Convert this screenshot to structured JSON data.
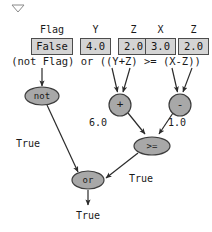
{
  "diagram": {
    "title_marker": "collapse-triangle",
    "variables": [
      {
        "name": "Flag",
        "value": "False",
        "box_width": 42
      },
      {
        "name": "Y",
        "value": "4.0",
        "box_width": 31
      },
      {
        "name": "Z",
        "value": "2.0",
        "box_width": 31
      },
      {
        "name": "X",
        "value": "3.0",
        "box_width": 31
      },
      {
        "name": "Z",
        "value": "2.0",
        "box_width": 31
      }
    ],
    "expression": {
      "part_left": "(not Flag)",
      "operator": " or ",
      "part_right": "((Y+Z) >= (X-Z))",
      "full": "(not Flag) or ((Y+Z) >= (X-Z))"
    },
    "nodes": [
      {
        "id": "not",
        "label": "not",
        "shape": "ellipse",
        "cx": 42,
        "cy": 96,
        "rx": 17,
        "ry": 9
      },
      {
        "id": "plus",
        "label": "+",
        "shape": "circle",
        "cx": 120,
        "cy": 105,
        "rx": 11,
        "ry": 11
      },
      {
        "id": "minus",
        "label": "-",
        "shape": "circle",
        "cx": 180,
        "cy": 105,
        "rx": 11,
        "ry": 11
      },
      {
        "id": "gte",
        "label": ">=",
        "shape": "ellipse",
        "cx": 152,
        "cy": 146,
        "rx": 18,
        "ry": 9
      },
      {
        "id": "or",
        "label": "or",
        "shape": "ellipse",
        "cx": 88,
        "cy": 180,
        "rx": 16,
        "ry": 9
      }
    ],
    "edge_labels": [
      {
        "id": "not-to-or",
        "text": "True",
        "x": 24,
        "y": 143
      },
      {
        "id": "plus-to-gte",
        "text": "6.0",
        "x": 97,
        "y": 122
      },
      {
        "id": "minus-to-gte",
        "text": "1.0",
        "x": 176,
        "y": 122
      },
      {
        "id": "gte-to-or",
        "text": "True",
        "x": 141,
        "y": 178
      },
      {
        "id": "or-output",
        "text": "True",
        "x": 88,
        "y": 215
      }
    ],
    "colors": {
      "node_fill": "#a8a8a8",
      "node_stroke": "#3d3d3d",
      "box_fill": "#d4d4d4",
      "box_stroke": "#4d4d4d",
      "text": "#1a1a1a",
      "edge": "#2b2b2b",
      "background": "#ffffff"
    }
  }
}
